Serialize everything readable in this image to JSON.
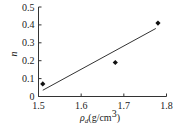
{
  "chart_data": {
    "type": "scatter",
    "title": "",
    "xlabel": "ρd(g/cm³)",
    "xlabel_symbol": "ρ",
    "xlabel_subscript": "d",
    "xlabel_unit": "(g/cm",
    "xlabel_unit_sup": "3",
    "xlabel_unit_close": ")",
    "ylabel": "n",
    "xlim": [
      1.5,
      1.8
    ],
    "ylim": [
      0,
      0.5
    ],
    "xticks": [
      "1.5",
      "1.6",
      "1.7",
      "1.8"
    ],
    "yticks": [
      "0",
      "0.1",
      "0.2",
      "0.3",
      "0.4",
      "0.5"
    ],
    "grid": false,
    "legend": null,
    "series": [
      {
        "name": "measured",
        "type": "scatter",
        "marker": "diamond",
        "x": [
          1.51,
          1.68,
          1.78
        ],
        "y": [
          0.07,
          0.19,
          0.41
        ]
      },
      {
        "name": "linear fit",
        "type": "line",
        "x": [
          1.51,
          1.775
        ],
        "y": [
          0.035,
          0.38
        ]
      }
    ]
  }
}
